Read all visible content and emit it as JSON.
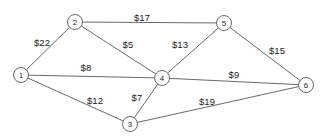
{
  "chart_data": {
    "type": "diagram",
    "diagram_kind": "weighted-undirected-graph",
    "title": "",
    "currency_symbol": "$",
    "background_color": "#ffffff",
    "line_color": "#58585a",
    "text_color": "#212121",
    "nodes": [
      {
        "id": "1",
        "label": "1",
        "x": 21,
        "y": 75,
        "r": 7.5
      },
      {
        "id": "2",
        "label": "2",
        "x": 75,
        "y": 22,
        "r": 7.5
      },
      {
        "id": "3",
        "label": "3",
        "x": 130,
        "y": 124,
        "r": 7.5
      },
      {
        "id": "4",
        "label": "4",
        "x": 162,
        "y": 78,
        "r": 7.5
      },
      {
        "id": "5",
        "label": "5",
        "x": 224,
        "y": 23,
        "r": 7.5
      },
      {
        "id": "6",
        "label": "6",
        "x": 306,
        "y": 85,
        "r": 7.5
      }
    ],
    "edges": [
      {
        "source": "1",
        "target": "2",
        "weight": 22,
        "label": "$22",
        "label_x": 42,
        "label_y": 42
      },
      {
        "source": "2",
        "target": "5",
        "weight": 17,
        "label": "$17",
        "label_x": 142,
        "label_y": 17
      },
      {
        "source": "2",
        "target": "4",
        "weight": 5,
        "label": "$5",
        "label_x": 128,
        "label_y": 44
      },
      {
        "source": "4",
        "target": "5",
        "weight": 13,
        "label": "$13",
        "label_x": 180,
        "label_y": 44
      },
      {
        "source": "5",
        "target": "6",
        "weight": 15,
        "label": "$15",
        "label_x": 277,
        "label_y": 50
      },
      {
        "source": "1",
        "target": "4",
        "weight": 8,
        "label": "$8",
        "label_x": 86,
        "label_y": 67
      },
      {
        "source": "1",
        "target": "3",
        "weight": 12,
        "label": "$12",
        "label_x": 95,
        "label_y": 100
      },
      {
        "source": "3",
        "target": "4",
        "weight": 7,
        "label": "$7",
        "label_x": 137,
        "label_y": 97
      },
      {
        "source": "4",
        "target": "6",
        "weight": 9,
        "label": "$9",
        "label_x": 234,
        "label_y": 74
      },
      {
        "source": "3",
        "target": "6",
        "weight": 19,
        "label": "$19",
        "label_x": 207,
        "label_y": 101
      }
    ]
  }
}
